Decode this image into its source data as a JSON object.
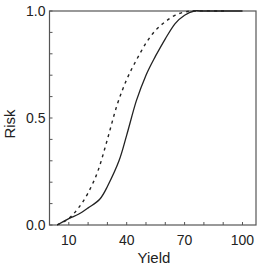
{
  "chart_data": {
    "type": "line",
    "title": "",
    "xlabel": "Yield",
    "ylabel": "Risk",
    "xlim": [
      0,
      107
    ],
    "ylim": [
      0,
      1.0
    ],
    "x_ticks": [
      10,
      40,
      70,
      100
    ],
    "x_minor_step": 10,
    "y_ticks": [
      0.0,
      0.5,
      1.0
    ],
    "y_tick_labels": [
      "0.0",
      "0.5",
      "1.0"
    ],
    "y_minor_step": 0.1,
    "grid": false,
    "legend": null,
    "series": [
      {
        "name": "solid",
        "style": "solid",
        "x": [
          4,
          10,
          15,
          20,
          26,
          30,
          36,
          40,
          45,
          50,
          55,
          60,
          65,
          70,
          75,
          80,
          100
        ],
        "values": [
          0.0,
          0.03,
          0.05,
          0.08,
          0.12,
          0.18,
          0.3,
          0.42,
          0.58,
          0.7,
          0.79,
          0.87,
          0.94,
          0.98,
          1.0,
          1.0,
          1.0
        ]
      },
      {
        "name": "dashed",
        "style": "dashed",
        "x": [
          4,
          10,
          15,
          20,
          25,
          30,
          35,
          40,
          45,
          50,
          55,
          60,
          65,
          70,
          75,
          92
        ],
        "values": [
          0.0,
          0.03,
          0.08,
          0.15,
          0.25,
          0.4,
          0.56,
          0.68,
          0.77,
          0.85,
          0.91,
          0.95,
          0.98,
          0.995,
          1.0,
          1.0
        ]
      }
    ]
  }
}
